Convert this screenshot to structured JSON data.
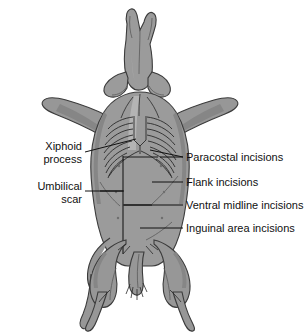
{
  "figure": {
    "view": "ventral"
  },
  "colors": {
    "background": "#ffffff",
    "body_fill": "#9b9b9b",
    "body_outline": "#3b3b3b",
    "shade_light": "#b4b4b4",
    "shade_dark": "#868686",
    "text": "#111111",
    "leader_line": "#111111",
    "incision_line": "#1b1b1b"
  },
  "labels_left": [
    {
      "name": "xiphoid-process",
      "lines": [
        "Xiphoid",
        "process"
      ],
      "text_x": 82,
      "line1_y": 150,
      "line2_y": 163,
      "leader_from_x": 85,
      "leader_from_y": 152,
      "leader_to_x": 136,
      "leader_to_y": 139
    },
    {
      "name": "umbilical-scar",
      "lines": [
        "Umbilical",
        "scar"
      ],
      "text_x": 82,
      "line1_y": 190,
      "line2_y": 203,
      "leader_from_x": 85,
      "leader_from_y": 191,
      "leader_to_x": 124,
      "leader_to_y": 191
    }
  ],
  "labels_right": [
    {
      "name": "paracostal-incisions",
      "text": "Paracostal incisions",
      "text_x": 186,
      "text_y": 161,
      "leader_from_x": 183,
      "leader_from_y": 157,
      "leader_to_x": 160,
      "leader_to_y": 157
    },
    {
      "name": "flank-incisions",
      "text": "Flank incisions",
      "text_x": 186,
      "text_y": 186,
      "leader_from_x": 183,
      "leader_from_y": 182,
      "leader_to_x": 152,
      "leader_to_y": 182
    },
    {
      "name": "ventral-midline-incisions",
      "text": "Ventral midline incisions",
      "text_x": 186,
      "text_y": 209,
      "leader_from_x": 183,
      "leader_from_y": 205,
      "leader_to_x": 124,
      "leader_to_y": 205
    },
    {
      "name": "inguinal-area-incisions",
      "text": "Inguinal area incisions",
      "text_x": 186,
      "text_y": 232,
      "leader_from_x": 183,
      "leader_from_y": 228,
      "leader_to_x": 140,
      "leader_to_y": 228
    }
  ],
  "anatomy": {
    "rib_count_per_side": 8,
    "features": [
      "head-snout",
      "ears",
      "forelimbs",
      "rib-cage",
      "xiphoid-process",
      "abdomen",
      "umbilical-scar",
      "hind-limbs",
      "tail"
    ]
  }
}
